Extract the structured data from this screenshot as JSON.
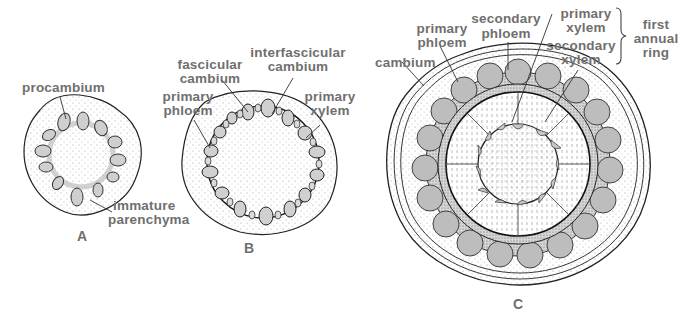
{
  "figure": {
    "panels": [
      {
        "id": "A",
        "caption": "A",
        "labels": {
          "procambium": "procambium",
          "immature_parenchyma_1": "immature",
          "immature_parenchyma_2": "parenchyma"
        }
      },
      {
        "id": "B",
        "caption": "B",
        "labels": {
          "fascicular_1": "fascicular",
          "fascicular_2": "cambium",
          "interfascicular_1": "interfascicular",
          "interfascicular_2": "cambium",
          "primary_phloem_1": "primary",
          "primary_phloem_2": "phloem",
          "primary_xylem_1": "primary",
          "primary_xylem_2": "xylem"
        }
      },
      {
        "id": "C",
        "caption": "C",
        "labels": {
          "cambium": "cambium",
          "primary_phloem_1": "primary",
          "primary_phloem_2": "phloem",
          "secondary_phloem_1": "secondary",
          "secondary_phloem_2": "phloem",
          "primary_xylem_1": "primary",
          "primary_xylem_2": "xylem",
          "secondary_xylem_1": "secondary",
          "secondary_xylem_2": "xylem",
          "annual_ring_1": "first",
          "annual_ring_2": "annual",
          "annual_ring_3": "ring"
        }
      }
    ],
    "colors": {
      "label": "#6f6f6f",
      "outline": "#222222",
      "stipple": "#9a9a9a",
      "bundle_fill": "#cfcfcf"
    }
  }
}
